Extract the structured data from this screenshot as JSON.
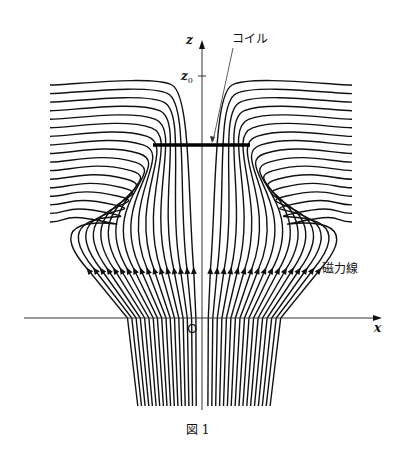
{
  "figure": {
    "caption": "図 1",
    "labels": {
      "z_axis": "z",
      "x_axis": "x",
      "z0": "z",
      "z0_sub": "0",
      "origin": "O",
      "coil": "コイル",
      "field_lines": "磁力線"
    },
    "geometry": {
      "axis_x": 202,
      "axis_y": 318,
      "z_axis_top": 40,
      "x_axis_left": 24,
      "x_axis_right": 382,
      "z0_y": 76,
      "coil": {
        "x1": 153,
        "x2": 250,
        "y": 145
      },
      "arrow_row_y": 270,
      "left_edge_x": 50,
      "right_edge_x": 352,
      "top_line_y": 85,
      "bottom_y": 406,
      "bottom_left_x": 136,
      "bottom_right_x": 272,
      "lines_per_side": 17
    },
    "colors": {
      "ink": "#111111",
      "axis": "#333333"
    }
  }
}
